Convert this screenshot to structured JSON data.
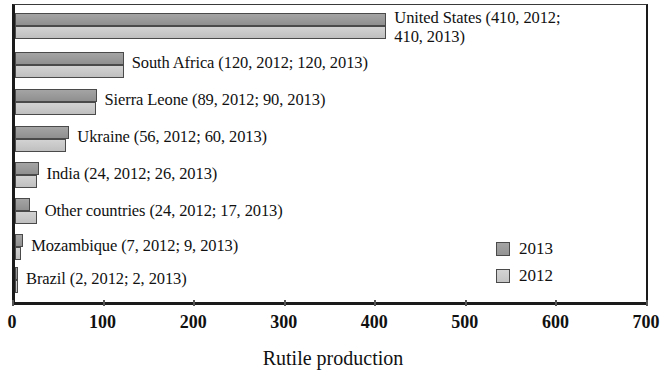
{
  "chart_data": {
    "type": "bar",
    "orientation": "horizontal",
    "title": "",
    "xlabel": "Rutile production",
    "ylabel": "",
    "xlim": [
      0,
      700
    ],
    "xticks": [
      0,
      100,
      200,
      300,
      400,
      500,
      600,
      700
    ],
    "grid": false,
    "legend_position": "lower-right-inside",
    "categories": [
      "United States",
      "South Africa",
      "Sierra Leone",
      "Ukraine",
      "India",
      "Other countries",
      "Mozambique",
      "Brazil"
    ],
    "series": [
      {
        "name": "2013",
        "color": "#9a9a9a",
        "values": [
          410,
          120,
          90,
          60,
          26,
          17,
          9,
          2
        ]
      },
      {
        "name": "2012",
        "color": "#c9c9c9",
        "values": [
          410,
          120,
          89,
          56,
          24,
          24,
          7,
          2
        ]
      }
    ],
    "data_labels": [
      "United States (410, 2012;\n410, 2013)",
      "South Africa (120, 2012; 120, 2013)",
      "Sierra Leone  (89, 2012; 90, 2013)",
      "Ukraine (56, 2012; 60, 2013)",
      "India (24, 2012; 26, 2013)",
      "Other countries (24, 2012; 17, 2013)",
      "Mozambique (7, 2012; 9, 2013)",
      "Brazil (2, 2012; 2, 2013)"
    ]
  },
  "axis": {
    "title": "Rutile production",
    "tick_labels": [
      "0",
      "100",
      "200",
      "300",
      "400",
      "500",
      "600",
      "700"
    ]
  },
  "legend": {
    "entries": [
      {
        "label": "2013"
      },
      {
        "label": "2012"
      }
    ]
  },
  "labels": {
    "united_states": "United States (410, 2012;\n410, 2013)",
    "south_africa": "South Africa (120, 2012; 120, 2013)",
    "sierra_leone": "Sierra Leone  (89, 2012; 90, 2013)",
    "ukraine": "Ukraine (56, 2012; 60, 2013)",
    "india": "India (24, 2012; 26, 2013)",
    "other_countries": "Other countries (24, 2012; 17, 2013)",
    "mozambique": "Mozambique (7, 2012; 9, 2013)",
    "brazil": "Brazil (2, 2012; 2, 2013)"
  }
}
